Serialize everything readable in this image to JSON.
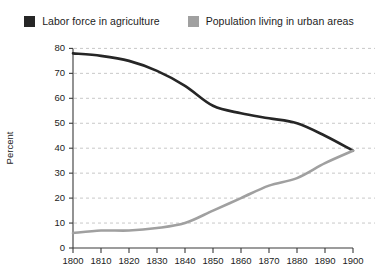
{
  "chart_data": {
    "type": "line",
    "title": "",
    "xlabel": "",
    "ylabel": "Percent",
    "xlim": [
      1800,
      1900
    ],
    "ylim": [
      0,
      80
    ],
    "grid": true,
    "legend_position": "top",
    "x": [
      1800,
      1810,
      1820,
      1830,
      1840,
      1850,
      1860,
      1870,
      1880,
      1890,
      1900
    ],
    "xtick_labels": [
      "1800",
      "1810",
      "1820",
      "1830",
      "1840",
      "1850",
      "1860",
      "1870",
      "1880",
      "1890",
      "1900"
    ],
    "ytick_labels": [
      "0",
      "10",
      "20",
      "30",
      "40",
      "50",
      "60",
      "70",
      "80"
    ],
    "ytick_values": [
      0,
      10,
      20,
      30,
      40,
      50,
      60,
      70,
      80
    ],
    "series": [
      {
        "name": "Labor force in agriculture",
        "color": "#262626",
        "values": [
          78,
          77,
          75,
          71,
          65,
          57,
          54,
          52,
          50,
          45,
          39
        ]
      },
      {
        "name": "Population living in urban areas",
        "color": "#a0a0a0",
        "values": [
          6,
          7,
          7,
          8,
          10,
          15,
          20,
          25,
          28,
          34,
          39
        ]
      }
    ]
  },
  "legend": {
    "items": [
      {
        "label": "Labor force in agriculture",
        "color": "#262626",
        "swatch_name": "legend-swatch-agriculture"
      },
      {
        "label": "Population living in urban areas",
        "color": "#a0a0a0",
        "swatch_name": "legend-swatch-urban"
      }
    ]
  },
  "axes": {
    "y_title": "Percent",
    "x_title": ""
  },
  "colors": {
    "series_dark": "#262626",
    "series_gray": "#a0a0a0",
    "gridline": "#c8c8c8",
    "axis": "#3a3a3a",
    "text": "#1c1c1c",
    "background": "#ffffff"
  }
}
